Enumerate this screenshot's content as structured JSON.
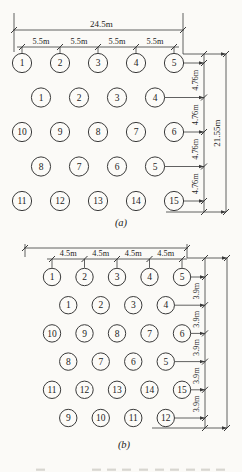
{
  "page_bg": "#fbfaf7",
  "ink": "#3a3a3a",
  "figure_a": {
    "panel_label": "(a)",
    "dim_top_total": "24.5m",
    "dim_top_segments": [
      "5.5m",
      "5.5m",
      "5.5m",
      "5.5m"
    ],
    "dim_right_segments": [
      "4.76m",
      "4.76m",
      "4.76m",
      "4.76m"
    ],
    "dim_right_total": "21.55m",
    "rows": [
      [
        "1",
        "2",
        "3",
        "4",
        "5"
      ],
      [
        "1",
        "2",
        "3",
        "4"
      ],
      [
        "10",
        "9",
        "8",
        "7",
        "6"
      ],
      [
        "8",
        "7",
        "6",
        "5"
      ],
      [
        "11",
        "12",
        "13",
        "14",
        "15"
      ]
    ]
  },
  "figure_b": {
    "panel_label": "(b)",
    "dim_top_segments": [
      "4.5m",
      "4.5m",
      "4.5m",
      "4.5m"
    ],
    "dim_right_segments": [
      "3.9m",
      "3.9m",
      "3.9m",
      "3.9m",
      "3.9m"
    ],
    "rows": [
      [
        "1",
        "2",
        "3",
        "4",
        "5"
      ],
      [
        "1",
        "2",
        "3",
        "4"
      ],
      [
        "10",
        "9",
        "8",
        "7",
        "6"
      ],
      [
        "8",
        "7",
        "6",
        "5"
      ],
      [
        "11",
        "12",
        "13",
        "14",
        "15"
      ],
      [
        "9",
        "10",
        "11",
        "12"
      ]
    ]
  }
}
